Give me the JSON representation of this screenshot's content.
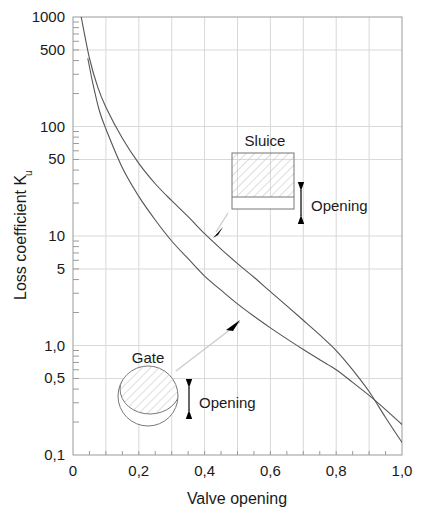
{
  "chart_data": {
    "type": "line",
    "title": "",
    "xlabel": "Valve opening",
    "ylabel": "Loss coefficient Ku",
    "ylabel_main": "Loss coefficient K",
    "ylabel_sub": "u",
    "xlim": [
      0,
      1.0
    ],
    "ylim": [
      0.1,
      1000
    ],
    "yscale": "log",
    "xscale": "linear",
    "grid": true,
    "legend_position": "none",
    "xticks": [
      "0",
      "0,2",
      "0,4",
      "0,6",
      "0,8",
      "1,0"
    ],
    "xtick_values": [
      0,
      0.2,
      0.4,
      0.6,
      0.8,
      1.0
    ],
    "yticks": [
      "1000",
      "500",
      "100",
      "50",
      "10",
      "5",
      "1,0",
      "0,5",
      "0,1"
    ],
    "ytick_values": [
      1000,
      500,
      100,
      50,
      10,
      5,
      1.0,
      0.5,
      0.1
    ],
    "series": [
      {
        "name": "Sluice",
        "x": [
          0.025,
          0.05,
          0.075,
          0.1,
          0.15,
          0.2,
          0.25,
          0.3,
          0.35,
          0.4,
          0.45,
          0.5,
          0.55,
          0.6,
          0.65,
          0.7,
          0.75,
          0.8,
          0.85,
          0.9,
          0.95,
          1.0
        ],
        "y": [
          1000,
          420,
          230,
          150,
          78,
          46,
          30,
          21,
          15,
          10.5,
          7.6,
          5.6,
          4.2,
          3.1,
          2.3,
          1.7,
          1.25,
          0.9,
          0.6,
          0.38,
          0.22,
          0.13
        ]
      },
      {
        "name": "Gate",
        "x": [
          0.045,
          0.06,
          0.08,
          0.1,
          0.15,
          0.2,
          0.25,
          0.3,
          0.35,
          0.4,
          0.45,
          0.5,
          0.55,
          0.6,
          0.65,
          0.7,
          0.75,
          0.8,
          0.85,
          0.9,
          0.95,
          1.0
        ],
        "y": [
          420,
          250,
          140,
          95,
          42,
          23,
          14,
          9.0,
          6.2,
          4.3,
          3.2,
          2.4,
          1.85,
          1.45,
          1.15,
          0.92,
          0.74,
          0.6,
          0.46,
          0.35,
          0.26,
          0.19
        ]
      }
    ],
    "annotations": [
      {
        "name": "sluice",
        "label": "Sluice",
        "opening_label": "Opening",
        "points_to_series": "Sluice"
      },
      {
        "name": "gate",
        "label": "Gate",
        "opening_label": "Opening",
        "points_to_series": "Gate"
      }
    ]
  },
  "axes": {
    "x_title": "Valve opening",
    "y_title_main": "Loss coefficient K",
    "y_title_sub": "u",
    "x_ticks": [
      {
        "value": 0,
        "label": "0"
      },
      {
        "value": 0.2,
        "label": "0,2"
      },
      {
        "value": 0.4,
        "label": "0,4"
      },
      {
        "value": 0.6,
        "label": "0,6"
      },
      {
        "value": 0.8,
        "label": "0,8"
      },
      {
        "value": 1.0,
        "label": "1,0"
      }
    ],
    "y_ticks": [
      {
        "value": 1000,
        "label": "1000"
      },
      {
        "value": 500,
        "label": "500"
      },
      {
        "value": 100,
        "label": "100"
      },
      {
        "value": 50,
        "label": "50"
      },
      {
        "value": 10,
        "label": "10"
      },
      {
        "value": 5,
        "label": "5"
      },
      {
        "value": 1.0,
        "label": "1,0"
      },
      {
        "value": 0.5,
        "label": "0,5"
      },
      {
        "value": 0.1,
        "label": "0,1"
      }
    ]
  },
  "insets": {
    "sluice": {
      "title": "Sluice",
      "opening_label": "Opening"
    },
    "gate": {
      "title": "Gate",
      "opening_label": "Opening"
    }
  },
  "colors": {
    "curve": "#555555",
    "grid": "#d8d8d8",
    "axis": "#9a9a9a",
    "text": "#1a1a1a",
    "arrow": "#000000",
    "leader": "#cccccc",
    "hatch": "#bbbbbb",
    "background": "#ffffff"
  }
}
